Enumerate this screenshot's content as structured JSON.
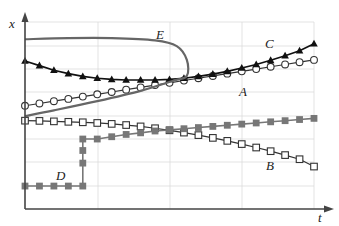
{
  "chart_data": {
    "type": "line",
    "title": "",
    "xlabel": "t",
    "ylabel": "x",
    "grid": true,
    "legend": "inline labels",
    "xlim": [
      0,
      20
    ],
    "ylim": [
      0,
      8.5
    ],
    "x": [
      0,
      1,
      2,
      3,
      4,
      5,
      6,
      7,
      8,
      9,
      10,
      11,
      12,
      13,
      14,
      15,
      16,
      17,
      18,
      19,
      20
    ],
    "series": [
      {
        "name": "A",
        "marker": "open-circle",
        "color": "#333333",
        "values": [
          4.5,
          4.6,
          4.7,
          4.8,
          4.9,
          5.0,
          5.1,
          5.2,
          5.3,
          5.4,
          5.5,
          5.6,
          5.7,
          5.8,
          5.9,
          6.0,
          6.1,
          6.2,
          6.3,
          6.4,
          6.5
        ]
      },
      {
        "name": "B",
        "marker": "open-square",
        "color": "#333333",
        "values": [
          3.85,
          3.84,
          3.82,
          3.8,
          3.78,
          3.75,
          3.71,
          3.66,
          3.6,
          3.52,
          3.43,
          3.33,
          3.22,
          3.1,
          2.97,
          2.83,
          2.68,
          2.52,
          2.35,
          2.17,
          1.85
        ]
      },
      {
        "name": "C",
        "marker": "filled-triangle",
        "color": "#111111",
        "values": [
          6.45,
          6.25,
          6.05,
          5.9,
          5.78,
          5.7,
          5.65,
          5.62,
          5.62,
          5.62,
          5.65,
          5.7,
          5.78,
          5.88,
          6.0,
          6.15,
          6.3,
          6.48,
          6.68,
          6.9,
          7.2
        ]
      },
      {
        "name": "D",
        "marker": "filled-square",
        "color": "#777777",
        "values": [
          1.0,
          1.0,
          1.0,
          1.0,
          1.0,
          3.05,
          3.15,
          3.25,
          3.32,
          3.4,
          3.45,
          3.5,
          3.55,
          3.6,
          3.65,
          3.7,
          3.75,
          3.8,
          3.85,
          3.9,
          3.95
        ],
        "note": "step jump at t=4: vertical markers at x=2.0 and 2.55 between 1.0 and 3.05"
      },
      {
        "name": "E",
        "marker": "none",
        "color": "#666666",
        "shape": "closed loop on left side",
        "points": [
          [
            0,
            7.4
          ],
          [
            3,
            7.45
          ],
          [
            6,
            7.45
          ],
          [
            9,
            7.35
          ],
          [
            10.5,
            7.1
          ],
          [
            11.2,
            6.5
          ],
          [
            11.2,
            5.8
          ],
          [
            10.3,
            5.6
          ],
          [
            8,
            5.15
          ],
          [
            5,
            4.7
          ],
          [
            2,
            4.3
          ],
          [
            0,
            4.05
          ]
        ]
      }
    ],
    "annotations": [
      {
        "text": "A",
        "x": 15,
        "y": 5.6
      },
      {
        "text": "B",
        "x": 15.5,
        "y": 2.3
      },
      {
        "text": "C",
        "x": 15,
        "y": 7.0
      },
      {
        "text": "D",
        "x": 2.5,
        "y": 1.25
      },
      {
        "text": "E",
        "x": 11,
        "y": 7.65
      }
    ]
  },
  "labels": {
    "x_axis": "t",
    "y_axis": "x",
    "A": "A",
    "B": "B",
    "C": "C",
    "D": "D",
    "E": "E"
  }
}
